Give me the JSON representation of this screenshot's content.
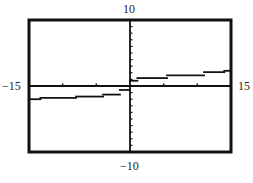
{
  "chart_data": {
    "type": "line",
    "title": "",
    "xlabel": "",
    "ylabel": "",
    "xlim": [
      -15,
      15
    ],
    "ylim": [
      -10,
      10
    ],
    "x_tick_step": 5,
    "y_tick_step": 1,
    "grid": false,
    "legend": null,
    "window_labels": {
      "xmin": "−15",
      "xmax": "15",
      "ymin": "−10",
      "ymax": "10"
    },
    "series": [
      {
        "name": "step-function",
        "style": "horizontal step segments",
        "segments": [
          {
            "x0": -15,
            "x1": -13.3,
            "y": -2.0
          },
          {
            "x0": -13.3,
            "x1": -8,
            "y": -1.8
          },
          {
            "x0": -8,
            "x1": -4,
            "y": -1.6
          },
          {
            "x0": -4,
            "x1": -1.5,
            "y": -1.3
          },
          {
            "x0": -1.5,
            "x1": 0,
            "y": -0.6
          },
          {
            "x0": 0,
            "x1": 1.1,
            "y": 0.8
          },
          {
            "x0": 1.1,
            "x1": 5.5,
            "y": 1.2
          },
          {
            "x0": 5.5,
            "x1": 11,
            "y": 1.6
          },
          {
            "x0": 11,
            "x1": 14,
            "y": 2.1
          },
          {
            "x0": 14,
            "x1": 15,
            "y": 2.3
          }
        ]
      }
    ]
  },
  "colors": {
    "ink": "#111111",
    "background": "#ffffff"
  },
  "layout": {
    "frame": {
      "left": 29,
      "top": 20,
      "right": 231,
      "bottom": 152
    }
  }
}
